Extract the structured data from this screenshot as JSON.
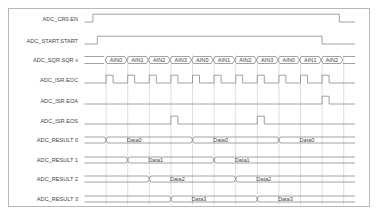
{
  "diagram": {
    "colors": {
      "line": "#8a8a8a",
      "grid": "#c8c8c8",
      "text": "#444444",
      "frame": "#b9b9b9"
    },
    "time_slots": 12,
    "signals": [
      {
        "id": "en",
        "label": "ADC_CR0.EN",
        "type": "level",
        "rise_slot": -0.7,
        "fall_slot": 10.8
      },
      {
        "id": "start",
        "label": "ADC_START.START",
        "type": "level",
        "rise_slot": -0.5,
        "fall_slot": 10.0
      },
      {
        "id": "sqr",
        "label": "ADC_SQR.SQR x",
        "type": "bus",
        "segments": [
          "AIN0",
          "AIN1",
          "AIN2",
          "AIN3",
          "AIN0",
          "AIN1",
          "AIN2",
          "AIN3",
          "AIN0",
          "AIN1",
          "AIN2"
        ]
      },
      {
        "id": "eoc",
        "label": "ADC_ISR.EOC",
        "type": "pulses",
        "pulse_slots": [
          1,
          2,
          3,
          4,
          5,
          6,
          7,
          8,
          9,
          10,
          11
        ]
      },
      {
        "id": "eoa",
        "label": "ADC_ISR.EOA",
        "type": "pulses",
        "pulse_slots": [
          11
        ]
      },
      {
        "id": "eos",
        "label": "ADC_ISR.EOS",
        "type": "pulses",
        "pulse_slots": [
          4,
          8
        ]
      },
      {
        "id": "r0",
        "label": "ADC_RESULT 0",
        "type": "data",
        "transitions": [
          1,
          5,
          9
        ],
        "values": [
          "Data0",
          "Data0",
          "Data0"
        ]
      },
      {
        "id": "r1",
        "label": "ADC_RESULT 1",
        "type": "data",
        "transitions": [
          2,
          6
        ],
        "values": [
          "Data1",
          "Data1"
        ]
      },
      {
        "id": "r2",
        "label": "ADC_RESULT 2",
        "type": "data",
        "transitions": [
          3,
          7
        ],
        "values": [
          "Data2",
          "Data2"
        ]
      },
      {
        "id": "r3",
        "label": "ADC_RESULT 3",
        "type": "data",
        "transitions": [
          4,
          8
        ],
        "values": [
          "Data3",
          "Data3"
        ]
      }
    ]
  }
}
